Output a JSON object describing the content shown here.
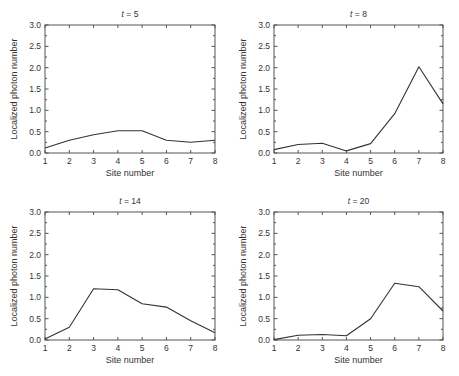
{
  "figure": {
    "caption_visible": "(caption text cut off at bottom edge — not legible)"
  },
  "chart_data": [
    {
      "type": "line",
      "title": "t = 5",
      "title_var": "t",
      "title_value": "5",
      "xlabel": "Site number",
      "ylabel": "Localized photon number",
      "x": [
        1,
        2,
        3,
        4,
        5,
        6,
        7,
        8
      ],
      "values": [
        0.12,
        0.3,
        0.43,
        0.52,
        0.52,
        0.3,
        0.25,
        0.3
      ],
      "xlim": [
        1,
        8
      ],
      "ylim": [
        0,
        3.0
      ],
      "xticks": [
        "1",
        "2",
        "3",
        "4",
        "5",
        "6",
        "7",
        "8"
      ],
      "yticks": [
        "0.0",
        "0.5",
        "1.0",
        "1.5",
        "2.0",
        "2.5",
        "3.0"
      ],
      "grid": false,
      "legend": null,
      "frame": {
        "left": 45,
        "top": 25,
        "right": 215,
        "bottom": 153
      }
    },
    {
      "type": "line",
      "title": "t = 8",
      "title_var": "t",
      "title_value": "8",
      "xlabel": "Site number",
      "ylabel": "Localized photon number",
      "x": [
        1,
        2,
        3,
        4,
        5,
        6,
        7,
        8
      ],
      "values": [
        0.08,
        0.2,
        0.23,
        0.05,
        0.22,
        0.92,
        2.02,
        1.15
      ],
      "xlim": [
        1,
        8
      ],
      "ylim": [
        0,
        3.0
      ],
      "xticks": [
        "1",
        "2",
        "3",
        "4",
        "5",
        "6",
        "7",
        "8"
      ],
      "yticks": [
        "0.0",
        "0.5",
        "1.0",
        "1.5",
        "2.0",
        "2.5",
        "3.0"
      ],
      "grid": false,
      "legend": null,
      "frame": {
        "left": 274,
        "top": 25,
        "right": 443,
        "bottom": 153
      }
    },
    {
      "type": "line",
      "title": "t = 14",
      "title_var": "t",
      "title_value": "14",
      "xlabel": "Site number",
      "ylabel": "Localized photon number",
      "x": [
        1,
        2,
        3,
        4,
        5,
        6,
        7,
        8
      ],
      "values": [
        0.02,
        0.3,
        1.2,
        1.18,
        0.85,
        0.77,
        0.45,
        0.17
      ],
      "xlim": [
        1,
        8
      ],
      "ylim": [
        0,
        3.0
      ],
      "xticks": [
        "1",
        "2",
        "3",
        "4",
        "5",
        "6",
        "7",
        "8"
      ],
      "yticks": [
        "0.0",
        "0.5",
        "1.0",
        "1.5",
        "2.0",
        "2.5",
        "3.0"
      ],
      "grid": false,
      "legend": null,
      "frame": {
        "left": 45,
        "top": 212,
        "right": 215,
        "bottom": 340
      }
    },
    {
      "type": "line",
      "title": "t = 20",
      "title_var": "t",
      "title_value": "20",
      "xlabel": "Site number",
      "ylabel": "Localized photon number",
      "x": [
        1,
        2,
        3,
        4,
        5,
        6,
        7,
        8
      ],
      "values": [
        0.01,
        0.11,
        0.13,
        0.1,
        0.5,
        1.33,
        1.25,
        0.68
      ],
      "xlim": [
        1,
        8
      ],
      "ylim": [
        0,
        3.0
      ],
      "xticks": [
        "1",
        "2",
        "3",
        "4",
        "5",
        "6",
        "7",
        "8"
      ],
      "yticks": [
        "0.0",
        "0.5",
        "1.0",
        "1.5",
        "2.0",
        "2.5",
        "3.0"
      ],
      "grid": false,
      "legend": null,
      "frame": {
        "left": 274,
        "top": 212,
        "right": 443,
        "bottom": 340
      }
    }
  ],
  "style": {
    "line_color": "#333333",
    "axis_color": "#555555",
    "text_color": "#333333"
  }
}
